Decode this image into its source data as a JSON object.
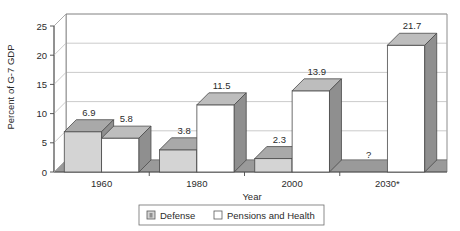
{
  "chart_data": {
    "type": "bar",
    "title": "",
    "xlabel": "Year",
    "ylabel": "Percent of G-7 GDP",
    "categories": [
      "1960",
      "1980",
      "2000",
      "2030*"
    ],
    "series": [
      {
        "name": "Defense",
        "values": [
          6.9,
          3.8,
          2.3,
          null
        ],
        "labels": [
          "6.9",
          "3.8",
          "2.3",
          "?"
        ]
      },
      {
        "name": "Pensions and Health",
        "values": [
          5.8,
          11.5,
          13.9,
          21.7
        ],
        "labels": [
          "5.8",
          "11.5",
          "13.9",
          "21.7"
        ]
      }
    ],
    "ylim": [
      0,
      25
    ],
    "yticks": [
      "0",
      "5",
      "10",
      "15",
      "20",
      "25"
    ],
    "ytick_values": [
      0,
      5,
      10,
      15,
      20,
      25
    ],
    "grid": true,
    "legend_position": "bottom",
    "style": "3d-column",
    "colors": {
      "defense_front": "#d4d4d4",
      "defense_top": "#a9a9a9",
      "defense_side": "#8f8f8f",
      "pensions_front": "#ffffff",
      "pensions_top": "#bdbdbd",
      "pensions_side": "#8f8f8f",
      "floor": "#9a9a9a",
      "grid": "#b5b5b5",
      "axis": "#4a4a4a",
      "text": "#2b2b2b"
    }
  },
  "legend": {
    "items": [
      {
        "label": "Defense",
        "swatch": "defense"
      },
      {
        "label": "Pensions and Health",
        "swatch": "pensions"
      }
    ]
  }
}
